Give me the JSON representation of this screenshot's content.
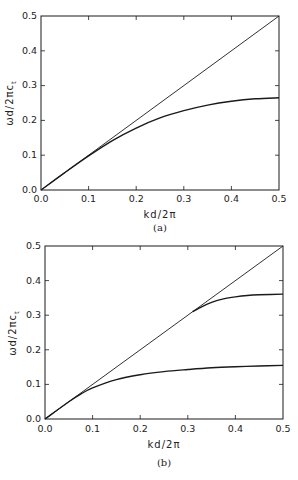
{
  "chart_data": [
    {
      "type": "line",
      "panel": "(a)",
      "caption": "(a)",
      "xlabel": "kd/2π",
      "ylabel": "ωd/2πc_t",
      "xlim": [
        0.0,
        0.5
      ],
      "ylim": [
        0.0,
        0.5
      ],
      "xticks": [
        "0.0",
        "0.1",
        "0.2",
        "0.3",
        "0.4",
        "0.5"
      ],
      "yticks": [
        "0.0",
        "0.1",
        "0.2",
        "0.3",
        "0.4",
        "0.5"
      ],
      "grid": false,
      "series": [
        {
          "name": "light line",
          "x": [
            0.0,
            0.5
          ],
          "y": [
            0.0,
            0.5
          ]
        },
        {
          "name": "dispersion branch",
          "x": [
            0.0,
            0.05,
            0.1,
            0.15,
            0.2,
            0.25,
            0.3,
            0.35,
            0.4,
            0.45,
            0.5
          ],
          "y": [
            0.0,
            0.05,
            0.098,
            0.142,
            0.178,
            0.207,
            0.228,
            0.244,
            0.255,
            0.262,
            0.265
          ]
        }
      ]
    },
    {
      "type": "line",
      "panel": "(b)",
      "caption": "(b)",
      "xlabel": "kd/2π",
      "ylabel": "ωd/2πc_t",
      "xlim": [
        0.0,
        0.5
      ],
      "ylim": [
        0.0,
        0.5
      ],
      "xticks": [
        "0.0",
        "0.1",
        "0.2",
        "0.3",
        "0.4",
        "0.5"
      ],
      "yticks": [
        "0.0",
        "0.1",
        "0.2",
        "0.3",
        "0.4",
        "0.5"
      ],
      "grid": false,
      "series": [
        {
          "name": "light line",
          "x": [
            0.0,
            0.5
          ],
          "y": [
            0.0,
            0.5
          ]
        },
        {
          "name": "lower branch",
          "x": [
            0.0,
            0.05,
            0.075,
            0.1,
            0.15,
            0.2,
            0.25,
            0.3,
            0.35,
            0.4,
            0.45,
            0.5
          ],
          "y": [
            0.0,
            0.05,
            0.072,
            0.09,
            0.114,
            0.128,
            0.137,
            0.143,
            0.148,
            0.151,
            0.153,
            0.155
          ]
        },
        {
          "name": "upper branch",
          "x": [
            0.31,
            0.33,
            0.35,
            0.375,
            0.4,
            0.425,
            0.45,
            0.5
          ],
          "y": [
            0.31,
            0.325,
            0.337,
            0.347,
            0.353,
            0.357,
            0.359,
            0.361
          ]
        }
      ]
    }
  ],
  "panels": {
    "a": {
      "caption": "(a)",
      "xlabel": "kd/2π",
      "ylabel_main": "ωd/2πc",
      "ylabel_sub": "t",
      "xticks": [
        "0.0",
        "0.1",
        "0.2",
        "0.3",
        "0.4",
        "0.5"
      ],
      "yticks": [
        "0.0",
        "0.1",
        "0.2",
        "0.3",
        "0.4",
        "0.5"
      ]
    },
    "b": {
      "caption": "(b)",
      "xlabel": "kd/2π",
      "ylabel_main": "ωd/2πc",
      "ylabel_sub": "t",
      "xticks": [
        "0.0",
        "0.1",
        "0.2",
        "0.3",
        "0.4",
        "0.5"
      ],
      "yticks": [
        "0.0",
        "0.1",
        "0.2",
        "0.3",
        "0.4",
        "0.5"
      ]
    }
  },
  "colors": {
    "line": "#1a1a1a",
    "background": "#ffffff"
  }
}
